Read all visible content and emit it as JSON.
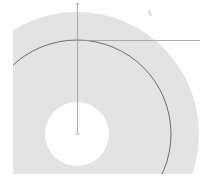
{
  "diagram": {
    "colors": {
      "background": "#ffffff",
      "disc_fill": "#e3e3e3",
      "hole_fill": "#ffffff",
      "arc_stroke": "#6d6d6d",
      "axis_stroke": "#9a9a9a"
    },
    "geometry": {
      "center": [
        77,
        134
      ],
      "outer_radius": 122,
      "reference_arc_radius": 94,
      "hole_radius": 32,
      "clip_left": 13,
      "clip_bottom": 174
    },
    "labels": {
      "axis_tick_top": "",
      "corner_mark": ""
    }
  }
}
